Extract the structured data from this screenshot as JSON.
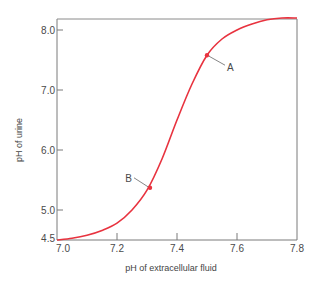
{
  "chart_data": {
    "type": "line",
    "title": "",
    "xlabel": "pH of extracellular fluid",
    "ylabel": "pH of urine",
    "xlim": [
      7.0,
      7.8
    ],
    "ylim": [
      4.5,
      8.2
    ],
    "grid": false,
    "legend": null,
    "x_ticks": [
      "7.0",
      "7.2",
      "7.4",
      "7.6",
      "7.8"
    ],
    "y_ticks": [
      "4.5",
      "5.0",
      "6.0",
      "7.0",
      "8.0"
    ],
    "series": [
      {
        "name": "urine pH vs extracellular pH",
        "color": "#e8333f",
        "x": [
          7.0,
          7.05,
          7.1,
          7.15,
          7.2,
          7.25,
          7.3,
          7.35,
          7.4,
          7.45,
          7.5,
          7.55,
          7.6,
          7.65,
          7.7,
          7.75,
          7.8
        ],
        "y": [
          4.5,
          4.53,
          4.58,
          4.66,
          4.78,
          5.0,
          5.33,
          5.85,
          6.5,
          7.1,
          7.58,
          7.85,
          8.0,
          8.1,
          8.17,
          8.2,
          8.2
        ]
      }
    ],
    "annotations": [
      {
        "label": "A",
        "x": 7.5,
        "y": 7.58
      },
      {
        "label": "B",
        "x": 7.31,
        "y": 5.37
      }
    ]
  }
}
